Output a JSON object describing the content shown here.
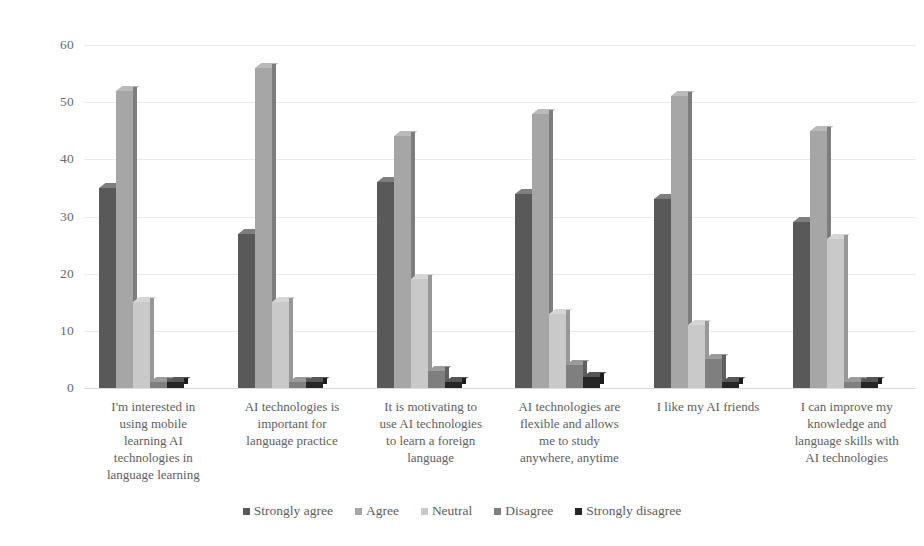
{
  "chart_data": {
    "type": "bar",
    "title": "",
    "subtitle": "",
    "xlabel": "",
    "ylabel": "",
    "ylim": [
      0,
      60
    ],
    "ytick_values": [
      60,
      50,
      40,
      30,
      20,
      10,
      0
    ],
    "ytick_labels": [
      "60",
      "50",
      "40",
      "30",
      "20",
      "10",
      "0"
    ],
    "grid": true,
    "grid_axis": "y",
    "legend_position": "bottom",
    "orientation": "vertical",
    "grouping": "clustered",
    "categories": [
      "I'm interested in using mobile learning AI technologies in language learning",
      "AI technologies is important for language practice",
      "It is motivating to use AI technologies to learn a foreign language",
      "AI technologies are flexible and allows me to study anywhere, anytime",
      "I like my AI friends",
      "I can improve my knowledge and language skills with AI technologies"
    ],
    "category_lines": [
      [
        "I'm interested in",
        "using mobile",
        "learning AI",
        "technologies in",
        "language learning"
      ],
      [
        "AI technologies is",
        "important for",
        "language practice"
      ],
      [
        "It is motivating to",
        "use AI technologies",
        "to learn a foreign",
        "language"
      ],
      [
        "AI technologies are",
        "flexible and allows",
        "me to study",
        "anywhere, anytime"
      ],
      [
        "I like my AI friends"
      ],
      [
        "I can improve my",
        "knowledge and",
        "language skills with",
        "AI technologies"
      ]
    ],
    "series": [
      {
        "name": "Strongly agree",
        "color": "#595959",
        "values": [
          35,
          27,
          36,
          34,
          33,
          29
        ]
      },
      {
        "name": "Agree",
        "color": "#a6a6a6",
        "values": [
          52,
          56,
          44,
          48,
          51,
          45
        ]
      },
      {
        "name": "Neutral",
        "color": "#c9c9c9",
        "values": [
          15,
          15,
          19,
          13,
          11,
          26
        ]
      },
      {
        "name": "Disagree",
        "color": "#7f7f7f",
        "values": [
          1,
          1,
          3,
          4,
          5,
          1
        ]
      },
      {
        "name": "Strongly disagree",
        "color": "#262626",
        "values": [
          1,
          1,
          1,
          2,
          1,
          1
        ]
      }
    ]
  },
  "legend": {
    "items": [
      {
        "label": "Strongly agree",
        "color": "#595959"
      },
      {
        "label": "Agree",
        "color": "#a6a6a6"
      },
      {
        "label": "Neutral",
        "color": "#c9c9c9"
      },
      {
        "label": "Disagree",
        "color": "#7f7f7f"
      },
      {
        "label": "Strongly disagree",
        "color": "#262626"
      }
    ]
  }
}
